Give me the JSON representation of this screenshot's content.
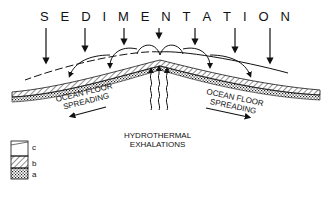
{
  "diagram": {
    "title_letters": [
      "S",
      "E",
      "D",
      "I",
      "M",
      "E",
      "N",
      "T",
      "A",
      "T",
      "I",
      "O",
      "N"
    ],
    "left_label": [
      "OCEAN FLOOR",
      "SPREADING"
    ],
    "right_label": [
      "OCEAN FLOOR",
      "SPREADING"
    ],
    "center_label": [
      "HYDROTHERMAL",
      "EXHALATIONS"
    ],
    "legend": [
      {
        "key": "c",
        "pattern": "sediment-blank"
      },
      {
        "key": "b",
        "pattern": "hatched"
      },
      {
        "key": "a",
        "pattern": "stippled"
      }
    ]
  }
}
